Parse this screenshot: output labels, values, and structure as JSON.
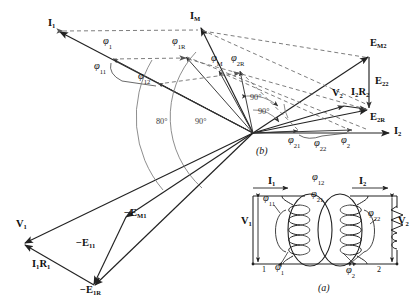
{
  "figure": {
    "title_b": "(b)",
    "title_a": "(a)"
  },
  "phasor": {
    "origin": {
      "x": 253,
      "y": 133
    },
    "vectors": [
      {
        "name": "I1",
        "label": "I",
        "sub": "1",
        "lx": 50,
        "ly": 23,
        "tipx": 57,
        "tipy": 33,
        "color": "#222222"
      },
      {
        "name": "IM",
        "label": "I",
        "sub": "M",
        "lx": 192,
        "ly": 16,
        "tipx": 200,
        "tipy": 28,
        "color": "#222222"
      },
      {
        "name": "I2",
        "label": "I",
        "sub": "2",
        "lx": 396,
        "ly": 128,
        "tipx": 390,
        "tipy": 133,
        "color": "#222222"
      },
      {
        "name": "EM2",
        "label": "E",
        "sub": "M2",
        "lx": 374,
        "ly": 43,
        "tipx": 369,
        "tipy": 56,
        "color": "#222222"
      },
      {
        "name": "E22",
        "label": "E",
        "sub": "22",
        "lx": 375,
        "ly": 81,
        "tipx": 369,
        "tipy": 110,
        "color": "#222222"
      },
      {
        "name": "E2R",
        "label": "E",
        "sub": "2R",
        "lx": 370,
        "ly": 115,
        "tipx": 369,
        "tipy": 110,
        "color": "#222222"
      },
      {
        "name": "V2",
        "label": "V",
        "sub": "2",
        "lx": 335,
        "ly": 93,
        "tipx": 330,
        "tipy": 106,
        "color": "#222222"
      },
      {
        "name": "I2R2",
        "label": "I",
        "sub": "2",
        "label2": "R",
        "sub2": "2",
        "lx": 352,
        "ly": 93,
        "tipx": 366,
        "tipy": 106,
        "color": "#222222"
      },
      {
        "name": "V1",
        "label": "V",
        "sub": "1",
        "lx": 17,
        "ly": 225,
        "tipx": 22,
        "tipy": 243,
        "color": "#222222"
      },
      {
        "name": "I1R1",
        "label": "I",
        "sub": "1",
        "label2": "R",
        "sub2": "1",
        "lx": 33,
        "ly": 264,
        "tipx": 22,
        "tipy": 243,
        "color": "#222222"
      },
      {
        "name": "-E11",
        "label": "−E",
        "sub": "11",
        "lx": 78,
        "ly": 243,
        "tipx": 90,
        "tipy": 285,
        "color": "#222222"
      },
      {
        "name": "-E1R",
        "label": "−E",
        "sub": "1R",
        "lx": 82,
        "ly": 288,
        "tipx": 93,
        "tipy": 285,
        "color": "#222222"
      },
      {
        "name": "-EM1",
        "label": "−E",
        "sub": "M1",
        "lx": 126,
        "ly": 211,
        "tipx": 126,
        "tipy": 216,
        "color": "#222222"
      }
    ],
    "flux_labels": [
      {
        "name": "phi1",
        "glyph": "φ",
        "sub": "1",
        "x": 105,
        "y": 41
      },
      {
        "name": "phi1R",
        "glyph": "φ",
        "sub": "1R",
        "x": 175,
        "y": 41
      },
      {
        "name": "phi11",
        "glyph": "φ",
        "sub": "11",
        "x": 97,
        "y": 66
      },
      {
        "name": "phi12",
        "glyph": "φ",
        "sub": "12",
        "x": 141,
        "y": 76
      },
      {
        "name": "phiM",
        "glyph": "φ",
        "sub": "M",
        "x": 214,
        "y": 58
      },
      {
        "name": "phi2R",
        "glyph": "φ",
        "sub": "2R",
        "x": 234,
        "y": 58
      },
      {
        "name": "phi21",
        "glyph": "φ",
        "sub": "21",
        "x": 291,
        "y": 138
      },
      {
        "name": "phi22",
        "glyph": "φ",
        "sub": "22",
        "x": 317,
        "y": 140
      },
      {
        "name": "phi2",
        "glyph": "φ",
        "sub": "2",
        "x": 344,
        "y": 138
      }
    ],
    "angle_labels": [
      {
        "name": "angle-80-left",
        "text": "80°",
        "x": 157,
        "y": 122
      },
      {
        "name": "angle-90-left",
        "text": "90°",
        "x": 196,
        "y": 122
      },
      {
        "name": "angle-90-upper",
        "text": "90°",
        "x": 251,
        "y": 98
      },
      {
        "name": "angle-90-lower",
        "text": "90°",
        "x": 259,
        "y": 112
      }
    ]
  },
  "circuit": {
    "label_a": "(a)",
    "terminal_left": "1",
    "terminal_right": "2",
    "currents": [
      {
        "name": "I1",
        "label": "I",
        "sub": "1",
        "x": 271,
        "y": 183
      },
      {
        "name": "I2",
        "label": "I",
        "sub": "2",
        "x": 362,
        "y": 183
      }
    ],
    "voltages": [
      {
        "name": "V1",
        "label": "V",
        "sub": "1",
        "x": 245,
        "y": 222
      },
      {
        "name": "V2",
        "label": "V",
        "sub": "2",
        "x": 399,
        "y": 222
      }
    ],
    "fluxes": [
      {
        "name": "phi12",
        "glyph": "φ",
        "sub": "12",
        "x": 318,
        "y": 178
      },
      {
        "name": "phi21",
        "glyph": "φ",
        "sub": "21",
        "x": 316,
        "y": 194
      },
      {
        "name": "phi11",
        "glyph": "φ",
        "sub": "11",
        "x": 266,
        "y": 198
      },
      {
        "name": "phi22",
        "glyph": "φ",
        "sub": "22",
        "x": 371,
        "y": 213
      },
      {
        "name": "phi1",
        "glyph": "φ",
        "sub": "1",
        "x": 278,
        "y": 264
      },
      {
        "name": "phi2",
        "glyph": "φ",
        "sub": "2",
        "x": 349,
        "y": 268
      }
    ]
  },
  "colors": {
    "ink": "#222222",
    "dashed": "#555555",
    "arc": "#6a6a6a",
    "paper": "#ffffff"
  }
}
